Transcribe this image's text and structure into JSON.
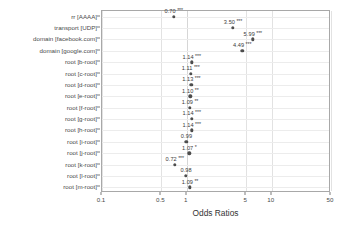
{
  "chart_data": {
    "type": "scatter",
    "title": "",
    "xlabel": "Odds Ratios",
    "ylabel": "",
    "xscale": "log",
    "xlim": [
      0.1,
      50
    ],
    "grid": true,
    "legend": "none",
    "xticks": [
      {
        "value": 0.1,
        "label": "0.1"
      },
      {
        "value": 0.5,
        "label": "0.5"
      },
      {
        "value": 1,
        "label": "1"
      },
      {
        "value": 5,
        "label": "5"
      },
      {
        "value": 10,
        "label": "10"
      },
      {
        "value": 50,
        "label": "50"
      }
    ],
    "categories": [
      "rr [AAAA]",
      "transport [UDP]",
      "domain [facebook.com]",
      "domain [google.com]",
      "root [b-root]",
      "root [c-root]",
      "root [d-root]",
      "root [e-root]",
      "root [f-root]",
      "root [g-root]",
      "root [h-root]",
      "root [i-root]",
      "root [j-root]",
      "root [k-root]",
      "root [l-root]",
      "root [m-root]"
    ],
    "values": [
      0.7,
      3.5,
      5.99,
      4.49,
      1.14,
      1.11,
      1.13,
      1.1,
      1.09,
      1.14,
      1.14,
      0.99,
      1.07,
      0.72,
      0.98,
      1.09
    ],
    "point_labels": [
      "0.70",
      "3.50",
      "5.99",
      "4.49",
      "1.14",
      "1.11",
      "1.13",
      "1.10",
      "1.09",
      "1.14",
      "1.14",
      "0.99",
      "1.07",
      "0.72",
      "0.98",
      "1.09"
    ],
    "significance": [
      "***",
      "***",
      "***",
      "***",
      "***",
      "***",
      "***",
      "**",
      "**",
      "***",
      "***",
      "",
      "*",
      "***",
      "",
      "**"
    ],
    "point_color": "#4d4d4d"
  }
}
